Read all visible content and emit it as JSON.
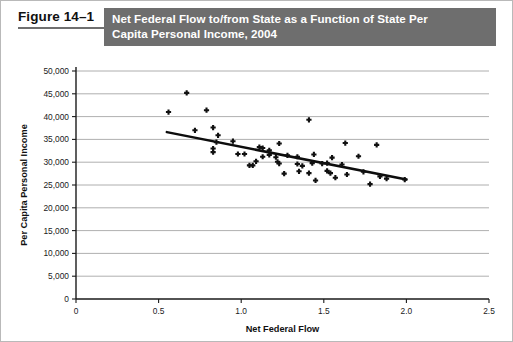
{
  "figure": {
    "label": "Figure 14–1",
    "title": "Net Federal Flow to/from State as a Function of State Per Capita Personal Income, 2004",
    "title_line1": "Net Federal Flow to/from State as a Function of State Per",
    "title_line2": "Capita Personal Income, 2004",
    "header_bg": "#6e6e6e",
    "header_text_color": "#ffffff"
  },
  "chart_data": {
    "type": "scatter",
    "title": "Net Federal Flow to/from State as a Function of State Per Capita Personal Income, 2004",
    "xlabel": "Net Federal Flow",
    "ylabel": "Per Capita Personal Income",
    "xlim": [
      0,
      2.5
    ],
    "ylim": [
      0,
      50000
    ],
    "xticks": [
      0,
      0.5,
      1.0,
      1.5,
      2.0,
      2.5
    ],
    "xtick_labels": [
      "0",
      "0.5",
      "1.0",
      "1.5",
      "2.0",
      "2.5"
    ],
    "yticks": [
      0,
      5000,
      10000,
      15000,
      20000,
      25000,
      30000,
      35000,
      40000,
      45000,
      50000
    ],
    "ytick_labels": [
      "0",
      "5,000",
      "10,000",
      "15,000",
      "20,000",
      "25,000",
      "30,000",
      "35,000",
      "40,000",
      "45,000",
      "50,000"
    ],
    "grid": "horizontal",
    "legend": null,
    "marker_color": "#101010",
    "marker_shape": "plus",
    "trendline": {
      "x": [
        0.55,
        2.0
      ],
      "y": [
        36600,
        26200
      ],
      "color": "#0d0d0d",
      "style": "solid"
    },
    "points": [
      {
        "x": 0.67,
        "y": 45200
      },
      {
        "x": 0.56,
        "y": 41000
      },
      {
        "x": 0.79,
        "y": 41400
      },
      {
        "x": 1.41,
        "y": 39300
      },
      {
        "x": 0.72,
        "y": 37000
      },
      {
        "x": 0.83,
        "y": 37600
      },
      {
        "x": 0.86,
        "y": 35900
      },
      {
        "x": 0.85,
        "y": 34400
      },
      {
        "x": 0.83,
        "y": 33000
      },
      {
        "x": 0.83,
        "y": 32200
      },
      {
        "x": 0.95,
        "y": 34600
      },
      {
        "x": 1.11,
        "y": 33300
      },
      {
        "x": 1.13,
        "y": 33100
      },
      {
        "x": 1.17,
        "y": 32600
      },
      {
        "x": 1.23,
        "y": 34100
      },
      {
        "x": 1.63,
        "y": 34200
      },
      {
        "x": 1.82,
        "y": 33800
      },
      {
        "x": 0.98,
        "y": 31800
      },
      {
        "x": 1.02,
        "y": 31800
      },
      {
        "x": 1.09,
        "y": 30200
      },
      {
        "x": 1.13,
        "y": 31200
      },
      {
        "x": 1.17,
        "y": 31600
      },
      {
        "x": 1.21,
        "y": 31100
      },
      {
        "x": 1.22,
        "y": 30100
      },
      {
        "x": 1.23,
        "y": 29700
      },
      {
        "x": 1.28,
        "y": 31500
      },
      {
        "x": 1.34,
        "y": 31200
      },
      {
        "x": 1.44,
        "y": 31700
      },
      {
        "x": 1.55,
        "y": 31000
      },
      {
        "x": 1.71,
        "y": 31300
      },
      {
        "x": 1.05,
        "y": 29300
      },
      {
        "x": 1.07,
        "y": 29300
      },
      {
        "x": 1.34,
        "y": 29600
      },
      {
        "x": 1.37,
        "y": 29200
      },
      {
        "x": 1.43,
        "y": 29800
      },
      {
        "x": 1.49,
        "y": 29700
      },
      {
        "x": 1.52,
        "y": 29800
      },
      {
        "x": 1.61,
        "y": 29500
      },
      {
        "x": 1.26,
        "y": 27500
      },
      {
        "x": 1.35,
        "y": 28000
      },
      {
        "x": 1.41,
        "y": 27600
      },
      {
        "x": 1.52,
        "y": 28100
      },
      {
        "x": 1.54,
        "y": 27600
      },
      {
        "x": 1.57,
        "y": 26600
      },
      {
        "x": 1.64,
        "y": 27300
      },
      {
        "x": 1.74,
        "y": 27900
      },
      {
        "x": 1.84,
        "y": 26900
      },
      {
        "x": 1.88,
        "y": 26400
      },
      {
        "x": 1.99,
        "y": 26200
      },
      {
        "x": 1.45,
        "y": 26000
      },
      {
        "x": 1.78,
        "y": 25200
      }
    ]
  }
}
